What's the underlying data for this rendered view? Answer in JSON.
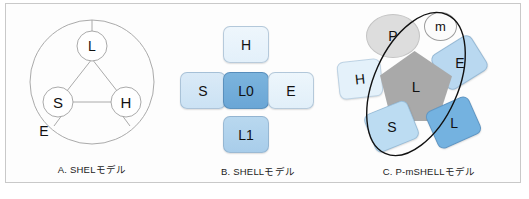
{
  "figure": {
    "background": "#fdfdfd",
    "border_color": "#c9c9c9"
  },
  "panels": [
    {
      "id": "A",
      "caption": "A.  SHELモデル",
      "type": "shel-circle-diagram",
      "outer_circle_label": "E",
      "nodes": [
        {
          "key": "L",
          "label": "L",
          "position": "top"
        },
        {
          "key": "S",
          "label": "S",
          "position": "bottom-left"
        },
        {
          "key": "H",
          "label": "H",
          "position": "bottom-right"
        }
      ],
      "stroke_color": "#999999"
    },
    {
      "id": "B",
      "caption": "B.  SHELLモデル",
      "type": "shell-cross-diagram",
      "boxes": [
        {
          "key": "H",
          "label": "H",
          "position": "top",
          "color": "#e6f2fb"
        },
        {
          "key": "S",
          "label": "S",
          "position": "left",
          "color": "#cfe4f5"
        },
        {
          "key": "L0",
          "label": "L0",
          "position": "center",
          "color": "#6fa9d8"
        },
        {
          "key": "E",
          "label": "E",
          "position": "right",
          "color": "#e5f1fb"
        },
        {
          "key": "L1",
          "label": "L1",
          "position": "bottom",
          "color": "#aed1ec"
        }
      ]
    },
    {
      "id": "C",
      "caption": "C.  P-mSHELLモデル",
      "type": "p-mshell-diagram",
      "shapes": [
        {
          "key": "P",
          "label": "P",
          "shape": "ellipse",
          "color": "#dddddd"
        },
        {
          "key": "m",
          "label": "m",
          "shape": "circle",
          "color": "#fcfcfc"
        },
        {
          "key": "L-core",
          "label": "L",
          "shape": "pentagon",
          "color": "#a9a9a9"
        },
        {
          "key": "H",
          "label": "H",
          "shape": "diamond",
          "color": "#e4f1fa"
        },
        {
          "key": "E",
          "label": "E",
          "shape": "diamond",
          "color": "#b9d8f0"
        },
        {
          "key": "S",
          "label": "S",
          "shape": "diamond",
          "color": "#bcdcf2"
        },
        {
          "key": "L-outer",
          "label": "L",
          "shape": "diamond",
          "color": "#74b2e0"
        }
      ],
      "overlay": {
        "name": "ellipse-outline",
        "color": "#111111"
      }
    }
  ]
}
